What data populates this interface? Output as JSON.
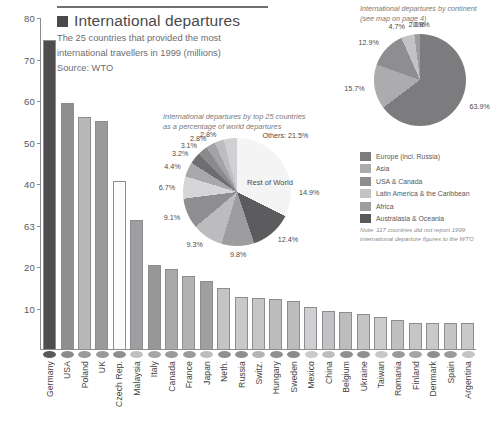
{
  "header": {
    "swatch_color": "#4a4a4c",
    "title": "International departures",
    "subtitle_line1": "The 25 countries that provided the most",
    "subtitle_line2": "international travellers in 1999 (millions)",
    "source": "Source: WTO"
  },
  "chart_data": [
    {
      "type": "bar",
      "title": "International departures",
      "subtitle": "The 25 countries that provided the most international travellers in 1999 (millions)",
      "source": "Source: WTO",
      "xlabel": "",
      "ylabel": "",
      "ylim": [
        0,
        80
      ],
      "grid": false,
      "ytick_labels": [
        "80",
        "70",
        "60",
        "50",
        "40",
        "63",
        "20",
        "10"
      ],
      "ytick_values": [
        80,
        70,
        60,
        50,
        40,
        30,
        20,
        10
      ],
      "categories": [
        "Germany",
        "USA",
        "Poland",
        "UK",
        "Czech Rep.",
        "Malaysia",
        "Italy",
        "Canada",
        "France",
        "Japan",
        "Neth.",
        "Russia",
        "Switz.",
        "Hungary",
        "Sweden",
        "Mexico",
        "China",
        "Belgium",
        "Ukraine",
        "Taiwan",
        "Romania",
        "Finland",
        "Denmark",
        "Spain",
        "Argentina"
      ],
      "values": [
        74.4,
        59.4,
        56.0,
        55.0,
        40.5,
        31.2,
        20.2,
        19.4,
        17.7,
        16.4,
        14.6,
        12.6,
        12.2,
        12.1,
        11.5,
        10.2,
        9.2,
        9.0,
        8.4,
        7.6,
        7.1,
        6.3,
        6.2,
        6.2,
        6.2
      ],
      "bar_colors": [
        "#4e4e50",
        "#8f8f91",
        "#b8b8ba",
        "#9a9a9c",
        "#fbfbfb",
        "#9f9fa1",
        "#97979a",
        "#a9a9ab",
        "#b2b2b4",
        "#a0a0a2",
        "#c4c4c6",
        "#c9c9cb",
        "#c6c6c8",
        "#bcbcbe",
        "#bcbcbe",
        "#cfcfd1",
        "#c2c2c4",
        "#bdbdbf",
        "#c4c4c6",
        "#cccccd",
        "#c0c0c2",
        "#c6c6c8",
        "#c9c9cb",
        "#c4c4c6",
        "#c9c9cb"
      ],
      "marker_colors": [
        "#5a5a5c",
        "#8b8b8d",
        "#9a9a9c",
        "#9a9a9c",
        "#8f8f91",
        "#c0c0c2",
        "#a5a5a7",
        "#9a9a9c",
        "#9a9a9c",
        "#bdbdbf",
        "#8f8f91",
        "#8f8f91",
        "#b5b5b7",
        "#8f8f91",
        "#8b8b8d",
        "#cacacc",
        "#bdbdbf",
        "#8f8f91",
        "#8f8f91",
        "#c7c7c9",
        "#9a9a9c",
        "#a5a5a7",
        "#8f8f91",
        "#9a9a9c",
        "#c4c4c6"
      ]
    },
    {
      "type": "pie",
      "title_line1": "International departures by top 25 countries",
      "title_line2": "as a percentage of world departures",
      "center_label": "Rest of World",
      "others_label": "Others: 21.5%",
      "labels": [
        "Rest of World",
        "Germany",
        "USA",
        "Poland",
        "UK",
        "Czech Rep.",
        "Malaysia",
        "Italy",
        "Canada",
        "France",
        "Japan",
        "Neth.",
        "Others"
      ],
      "values": [
        14.9,
        12.4,
        9.8,
        9.3,
        9.1,
        6.7,
        4.4,
        3.2,
        3.1,
        2.8,
        2.8,
        21.5
      ],
      "value_labels": [
        "14.9%",
        "12.4%",
        "9.8%",
        "9.3%",
        "9.1%",
        "6.7%",
        "4.4%",
        "3.2%",
        "3.1%",
        "2.8%",
        "2.8%",
        "Others: 21.5%"
      ],
      "slice_colors": [
        "#f4f4f4",
        "#5c5c5e",
        "#9d9d9f",
        "#bcbcbe",
        "#8e8e90",
        "#d6d6d8",
        "#a8a8aa",
        "#6e6e70",
        "#8a8a8c",
        "#a3a3a5",
        "#bdbdbf",
        "#d0d0d2"
      ]
    },
    {
      "type": "pie",
      "title_line1": "International departures by continent",
      "title_line2": "(see map on page 4)",
      "labels": [
        "Europe (incl. Russia)",
        "Asia",
        "USA & Canada",
        "Latin America & the Caribbean",
        "Africa",
        "Australasia & Oceania"
      ],
      "values": [
        63.9,
        15.7,
        12.9,
        4.7,
        2.0,
        0.8
      ],
      "value_labels": [
        "63.9%",
        "15.7%",
        "12.9%",
        "4.7%",
        "2.0%",
        "0.8%"
      ],
      "slice_colors": [
        "#7c7c7e",
        "#acacae",
        "#8e8e90",
        "#c3c3c5",
        "#9d9d9f",
        "#59595b"
      ]
    }
  ],
  "legend": {
    "items": [
      {
        "label": "Europe (incl. Russia)",
        "color": "#7c7c7e"
      },
      {
        "label": "Asia",
        "color": "#acacae"
      },
      {
        "label": "USA & Canada",
        "color": "#8e8e90"
      },
      {
        "label": "Latin America & the Caribbean",
        "color": "#c3c3c5"
      },
      {
        "label": "Africa",
        "color": "#9d9d9f"
      },
      {
        "label": "Australasia & Oceania",
        "color": "#59595b"
      }
    ],
    "note_line1": "Note: 117 countries did not report 1999",
    "note_line2": "international departure figures to the WTO"
  }
}
